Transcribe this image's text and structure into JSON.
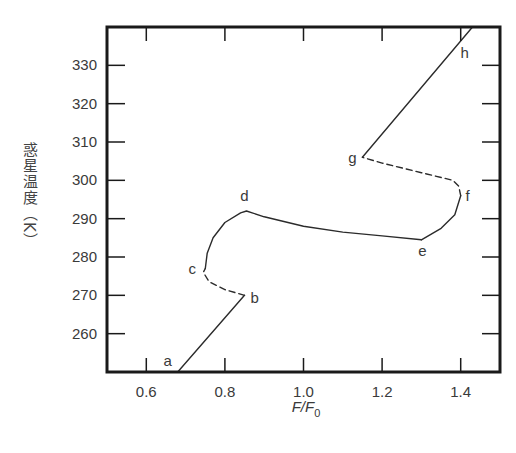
{
  "chart_data": {
    "type": "line",
    "title": "",
    "xlabel": "F/F0",
    "xlabel_main": "F/F",
    "xlabel_sub": "0",
    "ylabel": "惑星温度（K）",
    "xlim": [
      0.5,
      1.5
    ],
    "ylim": [
      250,
      340
    ],
    "xticks": [
      0.6,
      0.8,
      1.0,
      1.2,
      1.4
    ],
    "xtick_labels": [
      "0.6",
      "0.8",
      "1.0",
      "1.2",
      "1.4"
    ],
    "yticks": [
      260,
      270,
      280,
      290,
      300,
      310,
      320,
      330
    ],
    "ytick_labels": [
      "260",
      "270",
      "280",
      "290",
      "300",
      "310",
      "320",
      "330"
    ],
    "grid": false,
    "legend": null,
    "series": [
      {
        "name": "a-b",
        "style": "solid",
        "x": [
          0.68,
          0.85
        ],
        "y": [
          250,
          270
        ]
      },
      {
        "name": "b-c",
        "style": "dashed",
        "x": [
          0.85,
          0.8,
          0.76,
          0.745,
          0.75
        ],
        "y": [
          270,
          271.5,
          273.5,
          276,
          277
        ]
      },
      {
        "name": "c-d",
        "style": "solid",
        "x": [
          0.75,
          0.755,
          0.77,
          0.8,
          0.84,
          0.855,
          0.9,
          1.0,
          1.1,
          1.2,
          1.3
        ],
        "y": [
          277,
          281,
          285,
          289,
          291.5,
          292,
          290.5,
          288,
          286.5,
          285.5,
          284.5
        ]
      },
      {
        "name": "e-f",
        "style": "solid",
        "x": [
          1.3,
          1.35,
          1.385,
          1.4
        ],
        "y": [
          284.5,
          287.5,
          291,
          296
        ]
      },
      {
        "name": "f-g",
        "style": "dashed",
        "x": [
          1.4,
          1.395,
          1.38,
          1.3,
          1.2,
          1.15
        ],
        "y": [
          296,
          298.5,
          300,
          302,
          304.5,
          306
        ]
      },
      {
        "name": "g-h",
        "style": "solid",
        "x": [
          1.15,
          1.43
        ],
        "y": [
          306,
          340
        ]
      }
    ],
    "annotations": [
      {
        "text": "a",
        "x": 0.68,
        "y": 250
      },
      {
        "text": "b",
        "x": 0.85,
        "y": 270
      },
      {
        "text": "c",
        "x": 0.75,
        "y": 277
      },
      {
        "text": "d",
        "x": 0.855,
        "y": 292
      },
      {
        "text": "e",
        "x": 1.3,
        "y": 284.5
      },
      {
        "text": "f",
        "x": 1.4,
        "y": 296
      },
      {
        "text": "g",
        "x": 1.15,
        "y": 306
      },
      {
        "text": "h",
        "x": 1.42,
        "y": 336
      }
    ]
  },
  "layout": {
    "frame": {
      "left": 107,
      "top": 27,
      "right": 500,
      "bottom": 372
    },
    "line_color": "#2b2b2b"
  }
}
